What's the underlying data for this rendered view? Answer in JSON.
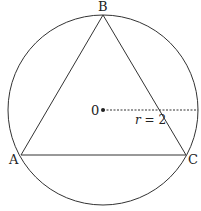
{
  "diagram": {
    "type": "inscribed-triangle-in-circle",
    "vertices": {
      "A": {
        "label": "A"
      },
      "B": {
        "label": "B"
      },
      "C": {
        "label": "C"
      }
    },
    "center": {
      "label": "0"
    },
    "radius": {
      "label_var": "r",
      "label_eq": " = 2"
    },
    "colors": {
      "stroke": "#333333",
      "background": "#ffffff"
    }
  }
}
